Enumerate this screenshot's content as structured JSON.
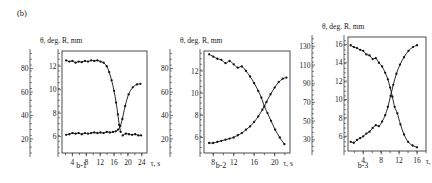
{
  "figure": {
    "panel_label": "(b)",
    "axis_title_theta": "θ, deg.",
    "axis_title_r": "R, mm",
    "x_axis_label": "τ, s"
  },
  "chart_data": [
    {
      "id": "b-1",
      "type": "scatter",
      "title": "θ, deg. R, mm",
      "sublabel": "b-1",
      "xlabel": "τ, s",
      "ylabel": "R, mm",
      "ylabel_secondary": "θ, deg.",
      "grid": false,
      "legend": "none",
      "xlim": [
        1,
        25.5
      ],
      "ylim": [
        4.6,
        13.3
      ],
      "ylim_theta": [
        8,
        95
      ],
      "xticks": [
        4,
        8,
        12,
        16,
        20,
        24
      ],
      "yticks": [
        6,
        8,
        10,
        12
      ],
      "yticks_theta": [
        20,
        40,
        60,
        80
      ],
      "series": [
        {
          "name": "R-upper-branch",
          "x": [
            2.2,
            3.1,
            4.0,
            4.9,
            5.8,
            6.7,
            7.6,
            8.5,
            9.4,
            10.3,
            11.2,
            12.1,
            13.0,
            13.9,
            14.6,
            15.3,
            16.0,
            16.6,
            17.1,
            17.5,
            17.9
          ],
          "y": [
            12.5,
            12.4,
            12.45,
            12.3,
            12.4,
            12.35,
            12.45,
            12.4,
            12.5,
            12.45,
            12.5,
            12.4,
            12.3,
            12.0,
            11.5,
            10.8,
            9.9,
            8.9,
            7.9,
            7.0,
            6.4
          ]
        },
        {
          "name": "theta-lower-branch",
          "x": [
            2.2,
            3.1,
            4.0,
            4.9,
            5.8,
            6.7,
            7.6,
            8.5,
            9.4,
            10.3,
            11.2,
            12.1,
            13.0,
            13.9,
            14.8,
            15.7,
            16.5,
            17.2,
            17.8,
            18.4,
            19.2,
            20.2,
            21.4,
            22.6,
            23.6
          ],
          "y": [
            6.15,
            6.2,
            6.3,
            6.25,
            6.3,
            6.2,
            6.3,
            6.25,
            6.3,
            6.35,
            6.3,
            6.35,
            6.3,
            6.4,
            6.35,
            6.4,
            6.45,
            6.6,
            6.9,
            7.5,
            8.6,
            9.6,
            10.2,
            10.45,
            10.5
          ]
        },
        {
          "name": "R-lower-tail",
          "x": [
            18.5,
            19.4,
            20.3,
            21.2,
            22.1,
            23.0,
            23.8
          ],
          "y": [
            6.1,
            6.25,
            6.2,
            6.15,
            6.2,
            6.1,
            6.1
          ]
        }
      ]
    },
    {
      "id": "b-2",
      "type": "scatter",
      "title": "θ, deg. R, mm",
      "sublabel": "b-2",
      "xlabel": "τ, s",
      "ylabel": "R, mm",
      "ylabel_secondary": "θ, deg.",
      "grid": false,
      "legend": "none",
      "xlim": [
        6.2,
        23.0
      ],
      "ylim": [
        4.6,
        13.8
      ],
      "ylim_theta": [
        8,
        95
      ],
      "xticks": [
        8,
        12,
        16,
        20
      ],
      "yticks": [
        6,
        8,
        10,
        12
      ],
      "yticks_theta": [
        20,
        40,
        60,
        80
      ],
      "series": [
        {
          "name": "R-descending-branch",
          "x": [
            7.2,
            8.0,
            8.8,
            9.6,
            10.4,
            11.2,
            12.0,
            12.8,
            13.6,
            14.4,
            15.2,
            16.0,
            16.8,
            17.4,
            18.0,
            18.6,
            19.3,
            20.1,
            21.0,
            21.9
          ],
          "y": [
            13.5,
            13.3,
            13.1,
            13.0,
            12.7,
            12.9,
            12.6,
            12.3,
            12.4,
            12.0,
            11.5,
            10.9,
            10.2,
            9.6,
            8.8,
            8.2,
            7.5,
            6.7,
            6.0,
            5.4
          ]
        },
        {
          "name": "theta-ascending-branch",
          "x": [
            7.2,
            8.0,
            8.8,
            9.6,
            10.4,
            11.2,
            12.0,
            12.8,
            13.6,
            14.4,
            15.2,
            16.0,
            16.8,
            17.6,
            18.4,
            19.2,
            20.0,
            20.8,
            21.6,
            22.3
          ],
          "y": [
            5.5,
            5.5,
            5.6,
            5.7,
            5.8,
            5.9,
            6.0,
            6.2,
            6.4,
            6.7,
            7.0,
            7.4,
            7.9,
            8.5,
            9.2,
            9.9,
            10.5,
            11.0,
            11.3,
            11.4
          ]
        }
      ]
    },
    {
      "id": "b-3",
      "type": "scatter",
      "title": "θ, deg. R, mm",
      "sublabel": "b-3",
      "xlabel": "τ, s",
      "ylabel": "R, mm",
      "ylabel_secondary": "θ, deg.",
      "grid": false,
      "legend": "none",
      "xlim": [
        0.6,
        18.0
      ],
      "ylim": [
        4.4,
        16.8
      ],
      "ylim_theta": [
        18,
        140
      ],
      "xticks": [
        4,
        8,
        12,
        16
      ],
      "yticks": [
        6,
        8,
        10,
        12,
        14,
        16
      ],
      "yticks_theta": [
        30,
        50,
        70,
        90,
        110,
        130
      ],
      "series": [
        {
          "name": "R-descending-branch",
          "x": [
            1.2,
            1.9,
            2.6,
            3.3,
            4.0,
            4.7,
            5.4,
            6.1,
            6.8,
            7.5,
            8.2,
            8.9,
            9.5,
            10.0,
            10.5,
            11.0,
            11.6,
            12.3,
            13.1,
            14.0,
            15.0,
            16.0
          ],
          "y": [
            15.9,
            15.7,
            15.6,
            15.4,
            15.3,
            14.9,
            14.8,
            14.4,
            14.5,
            14.0,
            13.6,
            12.9,
            12.2,
            11.3,
            10.3,
            9.2,
            8.5,
            7.3,
            6.2,
            5.4,
            5.0,
            4.8
          ]
        },
        {
          "name": "theta-ascending-branch",
          "x": [
            1.2,
            1.9,
            2.6,
            3.3,
            4.0,
            4.7,
            5.4,
            6.1,
            6.8,
            7.5,
            8.2,
            8.9,
            9.5,
            10.1,
            10.7,
            11.4,
            12.2,
            13.1,
            14.1,
            15.1,
            16.0
          ],
          "y": [
            5.4,
            5.3,
            5.6,
            5.8,
            6.0,
            6.3,
            6.5,
            6.9,
            7.2,
            7.1,
            7.6,
            8.3,
            9.2,
            10.4,
            11.6,
            12.8,
            13.8,
            14.6,
            15.3,
            15.7,
            15.9
          ]
        }
      ]
    }
  ]
}
